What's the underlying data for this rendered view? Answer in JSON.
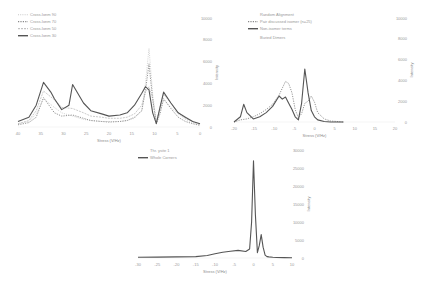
{
  "chart_data": [
    {
      "type": "line",
      "title": "",
      "xlabel": "Stress (V/Hz)",
      "ylabel": "Intensity",
      "xlim": [
        40,
        -10
      ],
      "ylim": [
        0,
        10000
      ],
      "xticks": [
        "40",
        "35",
        "30",
        "25",
        "20",
        "15",
        "10",
        "5",
        "0"
      ],
      "yticks": [
        "10000",
        "8000",
        "6000",
        "4000",
        "2000",
        "0"
      ],
      "legend": "top-left",
      "grid": false,
      "series": [
        {
          "name": "Cross-Ionm 90",
          "style": "dotted-light",
          "x": [
            40,
            37,
            35,
            33,
            30,
            28,
            25,
            22,
            20,
            17,
            15,
            12,
            10,
            8,
            6,
            5,
            4,
            3,
            2,
            1,
            0,
            -2,
            -4,
            -6,
            -8,
            -10
          ],
          "y": [
            300,
            500,
            1200,
            2600,
            1800,
            1300,
            1000,
            700,
            600,
            500,
            500,
            500,
            600,
            800,
            1500,
            4000,
            7200,
            3000,
            500,
            1500,
            2500,
            1800,
            1200,
            700,
            400,
            200
          ]
        },
        {
          "name": "Cross-Ionm 70",
          "style": "dotted",
          "x": [
            40,
            37,
            35,
            33,
            30,
            28,
            25,
            22,
            20,
            17,
            15,
            12,
            10,
            8,
            6,
            5,
            4,
            3,
            2,
            1,
            0,
            -2,
            -4,
            -6,
            -8,
            -10
          ],
          "y": [
            200,
            400,
            900,
            2700,
            1300,
            1000,
            1100,
            800,
            600,
            500,
            450,
            500,
            600,
            900,
            1500,
            3300,
            5800,
            2500,
            300,
            1200,
            2600,
            1700,
            900,
            500,
            300,
            150
          ]
        },
        {
          "name": "Cross-Ionm 50",
          "style": "dashed-light",
          "x": [
            40,
            37,
            35,
            33,
            30,
            28,
            25,
            22,
            20,
            17,
            15,
            12,
            10,
            8,
            6,
            5,
            4,
            3,
            2,
            1,
            0,
            -2,
            -4,
            -6,
            -8,
            -10
          ],
          "y": [
            300,
            600,
            1500,
            3300,
            2500,
            1800,
            1700,
            1300,
            1000,
            900,
            800,
            800,
            900,
            1200,
            2000,
            3200,
            3700,
            2600,
            400,
            1800,
            3000,
            2200,
            1300,
            800,
            500,
            250
          ]
        },
        {
          "name": "Cross-Ionm 30",
          "style": "solid",
          "x": [
            40,
            37,
            35,
            33,
            31,
            30,
            28,
            26,
            25,
            22,
            20,
            17,
            15,
            12,
            10,
            8,
            6,
            5,
            4,
            3,
            2,
            1,
            0,
            -2,
            -4,
            -6,
            -8,
            -10
          ],
          "y": [
            500,
            900,
            2000,
            4100,
            3200,
            2600,
            1600,
            2000,
            3900,
            2200,
            1500,
            1200,
            1000,
            1100,
            1300,
            2000,
            3100,
            3700,
            3400,
            1300,
            300,
            1800,
            3200,
            2200,
            1300,
            900,
            500,
            300
          ]
        }
      ]
    },
    {
      "type": "line",
      "title": "",
      "xlabel": "Stress (V/Hz)",
      "ylabel": "Intensity",
      "xlim": [
        -20,
        30
      ],
      "ylim": [
        0,
        10000
      ],
      "xticks": [
        "-20",
        "-15",
        "-10",
        "-5",
        "0",
        "5",
        "10",
        "15",
        "20"
      ],
      "yticks": [
        "10000",
        "8000",
        "6000",
        "4000",
        "2000",
        "0"
      ],
      "legend": "top-left",
      "legend_title": "Random Alignment",
      "legend_note": "Buried Dimers",
      "grid": false,
      "series": [
        {
          "name": "Pair discussed isomer (n=25)",
          "style": "dotted",
          "x": [
            -20,
            -18,
            -16,
            -14,
            -12,
            -10,
            -8,
            -6,
            -4,
            -3,
            -2,
            -1,
            0,
            1,
            2,
            3,
            4,
            5,
            6,
            8,
            10,
            12,
            14
          ],
          "y": [
            0,
            200,
            300,
            500,
            800,
            1200,
            1700,
            2600,
            3900,
            3700,
            2800,
            1200,
            400,
            800,
            1800,
            2000,
            2500,
            1900,
            900,
            300,
            100,
            50,
            0
          ]
        },
        {
          "name": "Non-isomer terms",
          "style": "solid",
          "x": [
            -20,
            -18,
            -17,
            -16,
            -14,
            -12,
            -10,
            -8,
            -6,
            -5,
            -4,
            -3,
            -2,
            -1,
            0,
            1,
            2,
            3,
            4,
            5,
            6,
            8,
            10,
            12,
            14
          ],
          "y": [
            0,
            500,
            1700,
            900,
            300,
            500,
            900,
            1500,
            2500,
            2200,
            2400,
            1800,
            1200,
            500,
            200,
            1800,
            5100,
            2800,
            1100,
            500,
            200,
            50,
            0,
            0,
            0
          ]
        }
      ]
    },
    {
      "type": "line",
      "title": "",
      "xlabel": "Stress (V/Hz)",
      "ylabel": "Intensity",
      "xlim": [
        -30,
        10
      ],
      "ylim": [
        0,
        30000
      ],
      "xticks": [
        "-30",
        "-25",
        "-20",
        "-15",
        "-10",
        "-5",
        "0",
        "5",
        "10"
      ],
      "yticks": [
        "30000",
        "25000",
        "20000",
        "15000",
        "10000",
        "5000",
        "0"
      ],
      "legend": "top-left",
      "legend_title": "Thr. ysite 1",
      "grid": false,
      "series": [
        {
          "name": "Whole Corners",
          "style": "solid",
          "x": [
            -30,
            -25,
            -20,
            -15,
            -12,
            -10,
            -8,
            -6,
            -4,
            -2,
            -1,
            -0.5,
            0,
            0.5,
            1,
            1.5,
            2,
            2.5,
            3,
            3.5,
            4,
            5,
            6,
            8,
            10
          ],
          "y": [
            200,
            250,
            300,
            400,
            700,
            1200,
            1600,
            1900,
            2100,
            1800,
            2500,
            10000,
            27000,
            12000,
            1500,
            3500,
            6500,
            3000,
            800,
            400,
            300,
            200,
            150,
            100,
            50
          ]
        }
      ]
    }
  ]
}
